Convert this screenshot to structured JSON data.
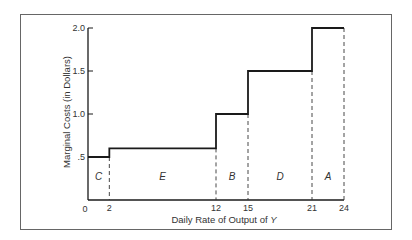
{
  "chart_data": {
    "type": "line",
    "subtype": "step",
    "title": "",
    "xlabel": "Daily Rate of Output of Y",
    "ylabel": "Marginal Costs (in Dollars)",
    "xlim": [
      0,
      24
    ],
    "ylim": [
      0,
      2.0
    ],
    "grid": false,
    "legend": null,
    "x_ticks": [
      0,
      2,
      12,
      15,
      21,
      24
    ],
    "x_tick_labels": [
      "0",
      "2",
      "12",
      "15",
      "21",
      "24"
    ],
    "y_ticks": [
      0.5,
      1.0,
      1.5,
      2.0
    ],
    "y_tick_labels": [
      ".5",
      "1.0",
      "1.5",
      "2.0"
    ],
    "segments": [
      {
        "label": "C",
        "x_start": 0,
        "x_end": 2,
        "marginal_cost": 0.5
      },
      {
        "label": "E",
        "x_start": 2,
        "x_end": 12,
        "marginal_cost": 0.6
      },
      {
        "label": "B",
        "x_start": 12,
        "x_end": 15,
        "marginal_cost": 1.0
      },
      {
        "label": "D",
        "x_start": 15,
        "x_end": 21,
        "marginal_cost": 1.5
      },
      {
        "label": "A",
        "x_start": 21,
        "x_end": 24,
        "marginal_cost": 2.0
      }
    ],
    "dashed_dividers_at_x": [
      2,
      12,
      15,
      21,
      24
    ]
  },
  "labels": {
    "xlabel": "Daily Rate of Output of ",
    "xlabel_var": "Y",
    "ylabel": "Marginal Costs (in Dollars)",
    "origin": "0"
  },
  "colors": {
    "line": "#1a1a1a",
    "frame": "#555555",
    "text": "#333333"
  }
}
